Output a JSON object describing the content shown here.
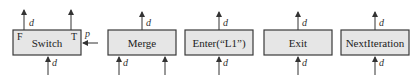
{
  "diagram": {
    "type": "control-flow-primitives",
    "nodes": [
      {
        "id": "switch",
        "label": "Switch",
        "ports": {
          "left_output": "F",
          "right_output": "T",
          "predicate_input": "p"
        },
        "inputs": [
          "d"
        ],
        "outputs": [
          "d",
          ""
        ]
      },
      {
        "id": "merge",
        "label": "Merge",
        "inputs": [
          "d",
          ""
        ],
        "outputs": [
          "d"
        ]
      },
      {
        "id": "enter",
        "label": "Enter(“L1”)",
        "inputs": [
          "d"
        ],
        "outputs": [
          "d"
        ]
      },
      {
        "id": "exit",
        "label": "Exit",
        "inputs": [
          "d"
        ],
        "outputs": [
          "d"
        ]
      },
      {
        "id": "nextiteration",
        "label": "NextIteration",
        "inputs": [
          "d"
        ],
        "outputs": [
          "d"
        ]
      }
    ],
    "edge_label": "d",
    "colors": {
      "box_fill": "#e6e6e6",
      "box_stroke": "#3a3a3a",
      "arrow": "#333333"
    }
  }
}
